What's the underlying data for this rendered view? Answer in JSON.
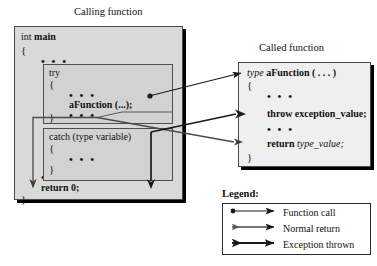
{
  "diagram": {
    "title_calling": "Calling function",
    "title_called": "Called function"
  },
  "calling_function": {
    "signature_type": "int",
    "signature_name": "main",
    "open_brace": "{",
    "dots_1": "• • •",
    "try_keyword": "try",
    "try_open_brace": "{",
    "try_dots_1": "• • •",
    "call_statement": "aFunction (...);",
    "try_dots_2": "• • •",
    "try_close_brace": "}",
    "catch_header": "catch (type variable)",
    "catch_open_brace": "{",
    "catch_dots": "• • •",
    "catch_close_brace": "}",
    "dots_2": "• • •",
    "return_statement": "return 0;",
    "close_brace": "}"
  },
  "called_function": {
    "signature_type": "type",
    "signature_name": "aFunction ( . . . )",
    "open_brace": "{",
    "dots_1": "• • •",
    "throw_statement": "throw exception_value;",
    "dots_2": "• • •",
    "return_keyword": "return",
    "return_value": "type_value;",
    "close_brace": "}"
  },
  "legend": {
    "title": "Legend:",
    "entries": [
      {
        "label": "Function call",
        "marker": "dot-start-arrow-end-line"
      },
      {
        "label": "Normal return",
        "marker": "small-arrow-start-arrow-end-line"
      },
      {
        "label": "Exception thrown",
        "marker": "large-arrow-start-arrow-end-line"
      }
    ]
  },
  "colors": {
    "calling_box_fill": "#d9d9d9",
    "inner_box_fill": "#d2d2d2",
    "called_box_fill": "#efefef",
    "legend_fill": "#ffffff",
    "border": "#4a4a4a",
    "line": "#1a1a1a",
    "text": "#111111"
  }
}
